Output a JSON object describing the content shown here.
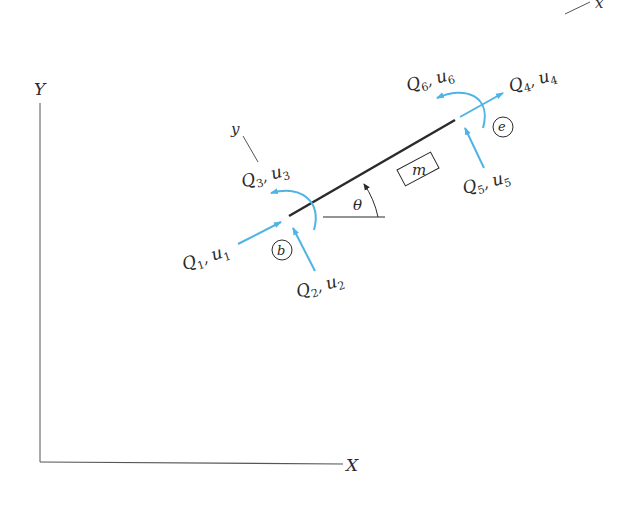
{
  "diagram": {
    "type": "beam-element-local-global-coordinates",
    "colors": {
      "ink": "#2a2a2a",
      "axis": "#555555",
      "beam": "#2b2b2b",
      "force": "#4fb3e6",
      "background": "#ffffff"
    },
    "global_axes": {
      "x_label": "X",
      "y_label": "Y"
    },
    "local_axes": {
      "x_label": "x",
      "y_label": "y"
    },
    "angle_label": "θ",
    "element_label": "m",
    "nodes": {
      "begin": {
        "label": "b"
      },
      "end": {
        "label": "e"
      }
    },
    "loads": [
      {
        "q": "Q",
        "q_sub": "1",
        "u": "u",
        "u_sub": "1",
        "node": "b",
        "kind": "axial"
      },
      {
        "q": "Q",
        "q_sub": "2",
        "u": "u",
        "u_sub": "2",
        "node": "b",
        "kind": "shear"
      },
      {
        "q": "Q",
        "q_sub": "3",
        "u": "u",
        "u_sub": "3",
        "node": "b",
        "kind": "moment"
      },
      {
        "q": "Q",
        "q_sub": "4",
        "u": "u",
        "u_sub": "4",
        "node": "e",
        "kind": "axial"
      },
      {
        "q": "Q",
        "q_sub": "5",
        "u": "u",
        "u_sub": "5",
        "node": "e",
        "kind": "shear"
      },
      {
        "q": "Q",
        "q_sub": "6",
        "u": "u",
        "u_sub": "6",
        "node": "e",
        "kind": "moment"
      }
    ]
  }
}
